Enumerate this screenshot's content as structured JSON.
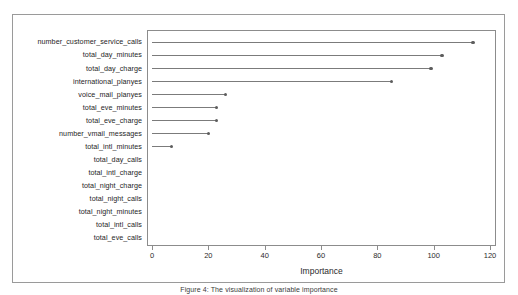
{
  "figure": {
    "caption": "Figure 4: The visualization of variable importance"
  },
  "chart_data": {
    "type": "bar",
    "title": "",
    "subtitle": "",
    "xlabel": "Importance",
    "ylabel": "",
    "xlim": [
      0,
      125
    ],
    "ylim": null,
    "grid": false,
    "legend": null,
    "orientation": "horizontal",
    "style": "cleveland-dot-plot",
    "xticks": [
      0,
      20,
      40,
      60,
      80,
      100,
      120
    ],
    "xticklabels": [
      "0",
      "20",
      "40",
      "60",
      "80",
      "100",
      "120"
    ],
    "categories": [
      "number_customer_service_calls",
      "total_day_minutes",
      "total_day_charge",
      "international_planyes",
      "voice_mail_planyes",
      "total_eve_minutes",
      "total_eve_charge",
      "number_vmail_messages",
      "total_intl_minutes",
      "total_day_calls",
      "total_intl_charge",
      "total_night_charge",
      "total_night_calls",
      "total_night_minutes",
      "total_intl_calls",
      "total_eve_calls"
    ],
    "values": [
      114,
      103,
      99,
      85,
      26,
      23,
      23,
      20,
      7,
      0,
      0,
      0,
      0,
      0,
      0,
      0
    ]
  }
}
